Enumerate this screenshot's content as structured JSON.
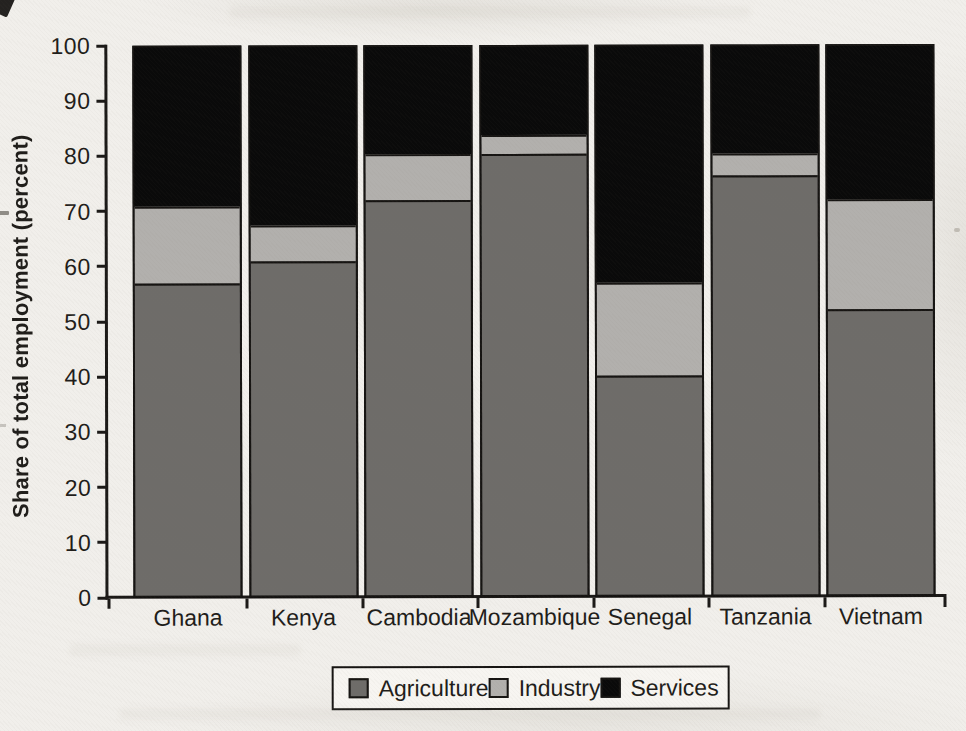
{
  "figure": {
    "background_color": "#f1efeb",
    "text_color": "#1f1d1a",
    "axis_color": "#1b1917"
  },
  "chart_data": {
    "type": "bar",
    "stacked": true,
    "title": "",
    "xlabel": "",
    "ylabel": "Share of total employment (percent)",
    "ylim": [
      0,
      100
    ],
    "yticks": [
      0,
      10,
      20,
      30,
      40,
      50,
      60,
      70,
      80,
      90,
      100
    ],
    "grid": false,
    "legend_position": "bottom",
    "categories": [
      "Ghana",
      "Kenya",
      "Cambodia",
      "Mozambique",
      "Senegal",
      "Tanzania",
      "Vietnam"
    ],
    "series": [
      {
        "name": "Agriculture",
        "color": "#6e6c69",
        "values": [
          57,
          61,
          72,
          80.5,
          40,
          76.5,
          52
        ]
      },
      {
        "name": "Industry",
        "color": "#b2b0ad",
        "values": [
          14,
          6.5,
          8.5,
          3.5,
          17,
          4,
          20
        ]
      },
      {
        "name": "Services",
        "color": "#0a0a0a",
        "values": [
          29,
          32.5,
          19.5,
          16,
          43,
          19.5,
          28
        ]
      }
    ]
  }
}
